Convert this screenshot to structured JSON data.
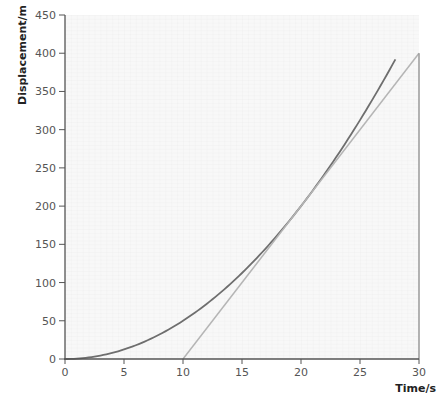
{
  "chart_data": {
    "type": "line",
    "title": "",
    "xlabel": "Time/s",
    "ylabel": "Displacement/m",
    "xlim": [
      0,
      30
    ],
    "ylim": [
      0,
      450
    ],
    "x_ticks": [
      0,
      5,
      10,
      15,
      20,
      25,
      30
    ],
    "y_ticks": [
      0,
      50,
      100,
      150,
      200,
      250,
      300,
      350,
      400,
      450
    ],
    "grid": true,
    "legend": null,
    "series": [
      {
        "name": "displacement curve",
        "color": "#6e6e6e",
        "x": [
          0,
          2,
          4,
          6,
          8,
          10,
          12,
          14,
          16,
          18,
          20,
          22,
          24,
          26,
          28
        ],
        "y": [
          0,
          2,
          8,
          18,
          32,
          50,
          72,
          98,
          128,
          162,
          200,
          242,
          288,
          338,
          392
        ]
      },
      {
        "name": "tangent at t = 20 s",
        "color": "#b5b5b5",
        "x": [
          10,
          30
        ],
        "y": [
          0,
          400
        ]
      },
      {
        "name": "vertical at t = 30 s",
        "color": "#9a9a9a",
        "x": [
          30,
          30
        ],
        "y": [
          0,
          400
        ]
      }
    ]
  },
  "axes": {
    "x_title": "Time/s",
    "y_title": "Displacement/m"
  }
}
